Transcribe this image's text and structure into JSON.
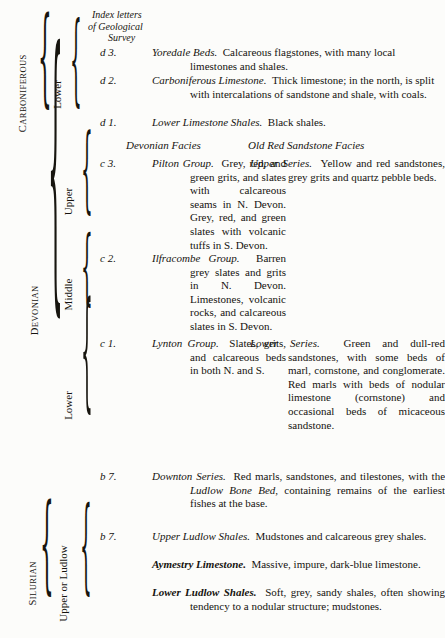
{
  "header": {
    "index_letters": [
      "Index  letters",
      "of Geological",
      "Survey"
    ]
  },
  "facies_headings": {
    "left": "Devonian Facies",
    "right": "Old Red Sandstone Facies"
  },
  "eras": [
    {
      "name": "CARBONIFEROUS",
      "display": "C",
      "rest": "ARBONIFEROUS"
    },
    {
      "name": "DEVONIAN",
      "display": "D",
      "rest": "EVONIAN"
    },
    {
      "name": "SILURIAN",
      "display": "S",
      "rest": "ILURIAN"
    }
  ],
  "series_labels": {
    "carboniferous_lower": "Lower",
    "devonian_upper": "Upper",
    "devonian_middle": "Middle",
    "devonian_lower": "Lower",
    "silurian_upper_ludlow": "Upper  or  Ludlow"
  },
  "rows": {
    "d3": {
      "index": "d 3.",
      "title": "Yoredale Beds.",
      "text": "Calcareous flagstones, with many local limestones and shales."
    },
    "d2": {
      "index": "d 2.",
      "title": "Carboniferous Limestone.",
      "text": "Thick limestone; in the north, is split with intercalations of sandstone and shale, with coals."
    },
    "d1": {
      "index": "d 1.",
      "title": "Lower Limestone Shales.",
      "text": "Black shales."
    },
    "c3": {
      "index": "c 3.",
      "title": "Pilton Group.",
      "text": "Grey, red, and green grits, and slates with calcareous seams in N. Devon. Grey, red, and green slates with volcanic tuffs in S. Devon.",
      "right_title": "Upper Series.",
      "right_text": "Yellow and red sandstones, grey grits and quartz pebble beds."
    },
    "c2": {
      "index": "c 2.",
      "title": "Ilfracombe Group.",
      "text": "Barren grey slates and grits in N. Devon. Limestones, volcanic rocks, and calcareous slates in S. Devon.",
      "right_title": "",
      "right_text": ""
    },
    "c1": {
      "index": "c 1.",
      "title": "Lynton Group.",
      "text": "Slates, grits, and calcareous beds in both N. and S.",
      "right_title": "Lower Series.",
      "right_text": "Green and dull-red sandstones, with some beds of marl, cornstone, and conglomerate. Red marls with beds of nodular limestone (cornstone) and occasional beds of micaceous sandstone."
    },
    "b7_downton": {
      "index": "b 7.",
      "title": "Downton Series.",
      "text_a": "Red marls, sandstones, and tilestones, with the ",
      "emphasis": "Ludlow Bone Bed",
      "text_b": ", containing remains of the earliest fishes at the base."
    },
    "b7_upper_ludlow": {
      "index": "b 7.",
      "title": "Upper Ludlow Shales.",
      "text": "Mudstones and calcareous grey shales."
    },
    "aymestry": {
      "index": "",
      "title": "Aymestry Limestone.",
      "text": "Massive, impure, dark-blue limestone."
    },
    "lower_ludlow": {
      "index": "",
      "title": "Lower Ludlow Shales.",
      "text": "Soft, grey, sandy shales, often showing tendency to a nodular structure; mudstones."
    }
  },
  "colors": {
    "ink": "#15130f",
    "paper": "#fcfcfa"
  }
}
